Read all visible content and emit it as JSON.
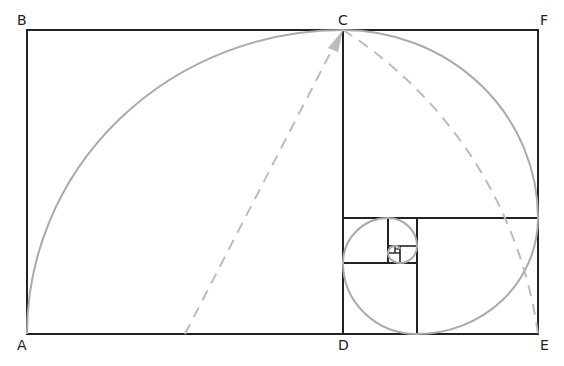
{
  "diagram": {
    "labels": {
      "A": "A",
      "B": "B",
      "C": "C",
      "D": "D",
      "E": "E",
      "F": "F"
    },
    "colors": {
      "square_stroke": "#222222",
      "spiral_stroke": "#aaaaaa",
      "dashed_stroke": "#bbbbbb"
    }
  }
}
